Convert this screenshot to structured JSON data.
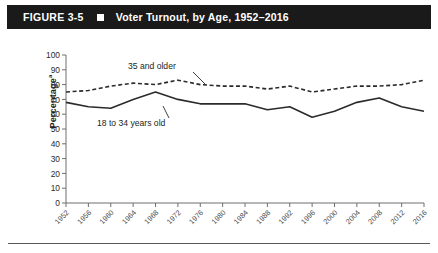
{
  "figure": {
    "number_label": "FIGURE 3-5",
    "bullet_icon": "square-bullet-icon",
    "title": "Voter Turnout, by Age, 1952–2016"
  },
  "axes": {
    "ylabel": "Percentage",
    "ylabel_superscript": "a",
    "yticks": [
      "0",
      "10",
      "20",
      "30",
      "40",
      "50",
      "60",
      "70",
      "80",
      "90",
      "100"
    ],
    "xticks": [
      "1952",
      "1956",
      "1960",
      "1964",
      "1968",
      "1972",
      "1976",
      "1980",
      "1984",
      "1988",
      "1992",
      "1996",
      "2000",
      "2004",
      "2008",
      "2012",
      "2016"
    ]
  },
  "annotations": {
    "older_label": "35 and older",
    "younger_label": "18 to 34 years old"
  },
  "colors": {
    "banner_bg": "#1a1a1a",
    "banner_text": "#ffffff",
    "line": "#2b2b2b",
    "axis": "#6e6e6e",
    "text": "#231f20"
  },
  "chart_data": {
    "type": "line",
    "title": "Voter Turnout, by Age, 1952–2016",
    "xlabel": "",
    "ylabel": "Percentage",
    "ylim": [
      0,
      100
    ],
    "ytick_step": 10,
    "grid": false,
    "legend": "inline-annotations",
    "categories": [
      "1952",
      "1956",
      "1960",
      "1964",
      "1968",
      "1972",
      "1976",
      "1980",
      "1984",
      "1988",
      "1992",
      "1996",
      "2000",
      "2004",
      "2008",
      "2012",
      "2016"
    ],
    "series": [
      {
        "name": "35 and older",
        "style": "dashed",
        "values": [
          75,
          76,
          79,
          81,
          80,
          83,
          80,
          79,
          79,
          77,
          79,
          75,
          77,
          79,
          79,
          80,
          83
        ]
      },
      {
        "name": "18 to 34 years old",
        "style": "solid",
        "values": [
          68,
          65,
          64,
          70,
          75,
          70,
          67,
          67,
          67,
          63,
          65,
          58,
          62,
          68,
          71,
          65,
          62
        ]
      }
    ]
  }
}
